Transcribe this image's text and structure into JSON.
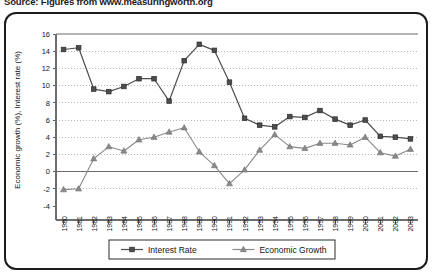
{
  "source_note": "Source: Figures from www.measuringworth.org",
  "chart_data": {
    "type": "line",
    "title": "",
    "xlabel": "Time",
    "ylabel": "Economic growth (%), Interest rate (%)",
    "ylim": [
      -4,
      16
    ],
    "yticks": [
      -4,
      -2,
      0,
      2,
      4,
      6,
      8,
      10,
      12,
      14,
      16
    ],
    "grid": true,
    "legend_position": "bottom",
    "categories": [
      "1980",
      "1981",
      "1982",
      "1983",
      "1984",
      "1985",
      "1986",
      "1987",
      "1988",
      "1989",
      "1990",
      "1991",
      "1992",
      "1993",
      "1994",
      "1995",
      "1996",
      "1997",
      "1998",
      "1999",
      "2000",
      "2001",
      "2002",
      "2003"
    ],
    "series": [
      {
        "name": "Interest Rate",
        "marker": "square",
        "color": "#4d4d4d",
        "values": [
          14.2,
          14.4,
          9.6,
          9.3,
          9.9,
          10.8,
          10.8,
          8.2,
          12.9,
          14.8,
          14.1,
          10.4,
          6.2,
          5.4,
          5.2,
          6.4,
          6.3,
          7.1,
          6.1,
          5.4,
          6.0,
          4.1,
          4.0,
          3.8
        ]
      },
      {
        "name": "Economic Growth",
        "marker": "triangle",
        "color": "#8a8a8a",
        "values": [
          -2.1,
          -2.0,
          1.5,
          2.9,
          2.4,
          3.7,
          4.0,
          4.6,
          5.1,
          2.3,
          0.7,
          -1.4,
          0.2,
          2.5,
          4.3,
          2.9,
          2.7,
          3.3,
          3.3,
          3.1,
          4.0,
          2.2,
          1.8,
          2.6
        ]
      }
    ]
  }
}
